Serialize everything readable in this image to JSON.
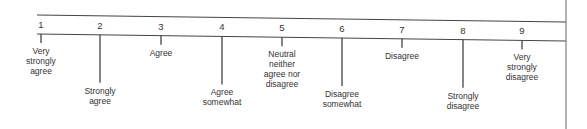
{
  "diagram": {
    "type": "rating-scale",
    "points": [
      {
        "number": "1",
        "label": [
          "Very",
          "strongly",
          "agree"
        ],
        "stem": "short"
      },
      {
        "number": "2",
        "label": [
          "Strongly",
          "agree"
        ],
        "stem": "long"
      },
      {
        "number": "3",
        "label": [
          "Agree"
        ],
        "stem": "short"
      },
      {
        "number": "4",
        "label": [
          "Agree",
          "somewhat"
        ],
        "stem": "long"
      },
      {
        "number": "5",
        "label": [
          "Neutral",
          "neither",
          "agree nor",
          "disagree"
        ],
        "stem": "short"
      },
      {
        "number": "6",
        "label": [
          "Disagree",
          "somewhat"
        ],
        "stem": "long"
      },
      {
        "number": "7",
        "label": [
          "Disagree"
        ],
        "stem": "short"
      },
      {
        "number": "8",
        "label": [
          "Strongly",
          "disagree"
        ],
        "stem": "long"
      },
      {
        "number": "9",
        "label": [
          "Very",
          "strongly",
          "disagree"
        ],
        "stem": "short"
      }
    ]
  }
}
